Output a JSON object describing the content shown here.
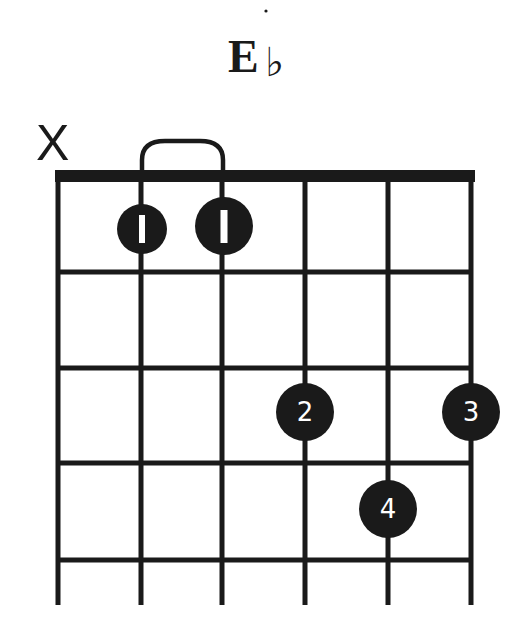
{
  "chord": {
    "name": "E",
    "accidental": "♭",
    "full_name": "E♭"
  },
  "diagram": {
    "strings": 6,
    "frets_shown": 4,
    "string_x": [
      58,
      141,
      222,
      305,
      388,
      471
    ],
    "fret_y": [
      176,
      272,
      368,
      463,
      560
    ],
    "string_bottom_y": 605,
    "colors": {
      "ink": "#1a1a1a",
      "background": "#ffffff",
      "finger_text": "#ffffff"
    }
  },
  "string_markers": [
    {
      "string": 1,
      "marker": "X",
      "label": "muted"
    }
  ],
  "barre": {
    "from_string": 2,
    "to_string": 3,
    "fret": 1
  },
  "fingers": [
    {
      "string": 2,
      "fret": 1,
      "finger": "1",
      "cx": 142,
      "cy": 229,
      "r": 25
    },
    {
      "string": 3,
      "fret": 1,
      "finger": "1",
      "cx": 224,
      "cy": 226,
      "r": 29
    },
    {
      "string": 4,
      "fret": 3,
      "finger": "2",
      "cx": 305,
      "cy": 412,
      "r": 29
    },
    {
      "string": 6,
      "fret": 3,
      "finger": "3",
      "cx": 471,
      "cy": 412,
      "r": 29
    },
    {
      "string": 5,
      "fret": 4,
      "finger": "4",
      "cx": 388,
      "cy": 509,
      "r": 29
    }
  ]
}
